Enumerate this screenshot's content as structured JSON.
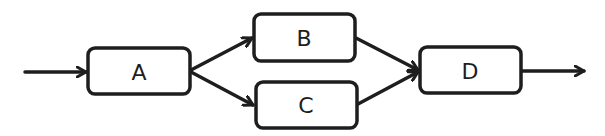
{
  "diagram": {
    "type": "flow",
    "stroke_color": "#1e1e1e",
    "background": "#ffffff",
    "nodes": [
      {
        "id": "A",
        "label": "A",
        "x": 88,
        "y": 48,
        "w": 102,
        "h": 46
      },
      {
        "id": "B",
        "label": "B",
        "x": 254,
        "y": 14,
        "w": 101,
        "h": 47
      },
      {
        "id": "C",
        "label": "C",
        "x": 256,
        "y": 82,
        "w": 101,
        "h": 46
      },
      {
        "id": "D",
        "label": "D",
        "x": 420,
        "y": 47,
        "w": 101,
        "h": 46
      }
    ],
    "edges": [
      {
        "from": "start",
        "to": "A"
      },
      {
        "from": "A",
        "to": "B"
      },
      {
        "from": "A",
        "to": "C"
      },
      {
        "from": "B",
        "to": "D"
      },
      {
        "from": "C",
        "to": "D"
      },
      {
        "from": "D",
        "to": "end"
      }
    ]
  }
}
